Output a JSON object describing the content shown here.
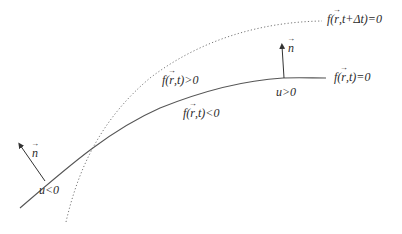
{
  "diagram": {
    "colors": {
      "background": "#ffffff",
      "curve": "#555555",
      "dotted_curve": "#777777",
      "text": "#2a2a2a"
    },
    "labels": {
      "future_front": "f(r,t+Δt)=0",
      "future_front_parts": {
        "pre": "f(",
        "vec": "r",
        "post": ",t+Δt)=0"
      },
      "current_front": "f(r,t)=0",
      "current_front_parts": {
        "pre": "f(",
        "vec": "r",
        "post": ",t)=0"
      },
      "positive_region": "f(r,t)>0",
      "positive_region_parts": {
        "pre": "f(",
        "vec": "r",
        "post": ",t)>0"
      },
      "negative_region": "f(r,t)<0",
      "negative_region_parts": {
        "pre": "f(",
        "vec": "r",
        "post": ",t)<0"
      },
      "speed_positive": "u>0",
      "speed_negative": "u<0",
      "normal_right": "n",
      "normal_left": "n"
    },
    "curves": [
      {
        "name": "current-front",
        "style": "solid",
        "label": "f(r,t)=0"
      },
      {
        "name": "future-front",
        "style": "dotted",
        "label": "f(r,t+Δt)=0"
      }
    ],
    "normals": [
      {
        "name": "normal-right",
        "at": "u>0 side",
        "direction": "up"
      },
      {
        "name": "normal-left",
        "at": "u<0 side",
        "direction": "up-left"
      }
    ]
  }
}
